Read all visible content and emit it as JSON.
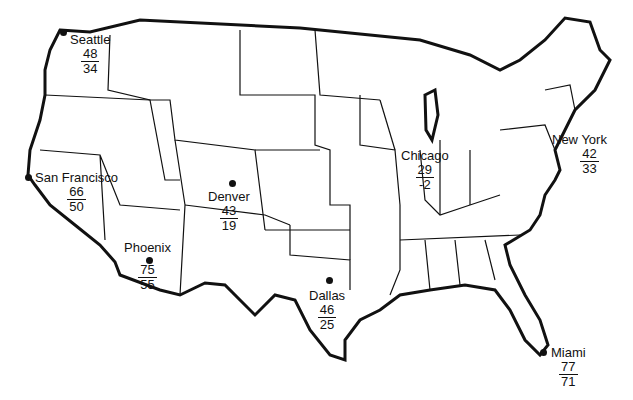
{
  "map": {
    "title": "",
    "colors": {
      "outline": "#111111",
      "background": "#ffffff"
    }
  },
  "cities": [
    {
      "name": "Seattle",
      "high": "48",
      "low": "34"
    },
    {
      "name": "San Francisco",
      "high": "66",
      "low": "50"
    },
    {
      "name": "Denver",
      "high": "43",
      "low": "19"
    },
    {
      "name": "Phoenix",
      "high": "75",
      "low": "55"
    },
    {
      "name": "Dallas",
      "high": "46",
      "low": "25"
    },
    {
      "name": "Chicago",
      "high": "29",
      "low": "-2"
    },
    {
      "name": "New York",
      "high": "42",
      "low": "33"
    },
    {
      "name": "Miami",
      "high": "77",
      "low": "71"
    }
  ]
}
